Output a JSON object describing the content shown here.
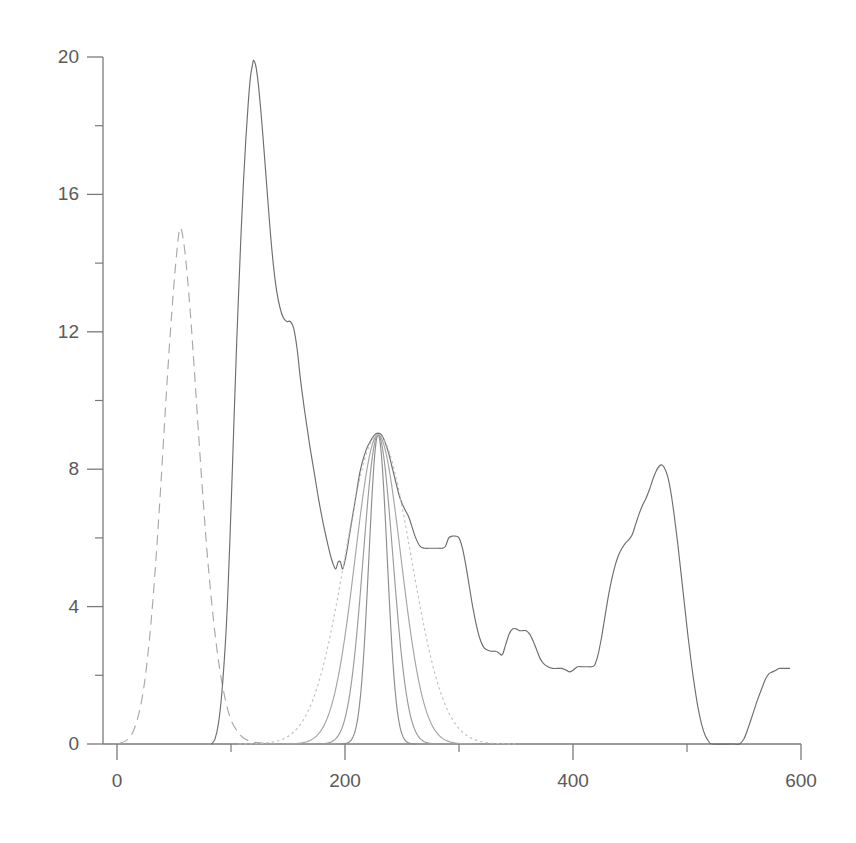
{
  "chart_data": {
    "type": "line",
    "title": "",
    "subtitle": "",
    "xlabel": "",
    "ylabel": "",
    "xlim": [
      0,
      600
    ],
    "ylim": [
      0,
      20.6
    ],
    "grid": false,
    "legend": "none",
    "background_color": "#ffffff",
    "axis_color": "#7a7a7a",
    "label_color": "#5a5a5a",
    "x_ticks_major": [
      0,
      200,
      400,
      600
    ],
    "x_ticks_major_labels": [
      "0",
      "200",
      "400",
      "600"
    ],
    "x_ticks_minor": [
      100,
      300,
      500
    ],
    "y_ticks_major": [
      0,
      4,
      8,
      12,
      16,
      20
    ],
    "y_ticks_major_labels": [
      "0",
      "4",
      "8",
      "12",
      "16",
      "20"
    ],
    "y_ticks_minor": [
      2,
      6,
      10,
      14,
      18
    ],
    "series": [
      {
        "name": "dashed-left-peak",
        "style": "dashed",
        "color": "#a8a8a8",
        "peak_x": 55,
        "peak_y": 15.0,
        "points": [
          [
            2,
            0.02
          ],
          [
            8,
            0.1
          ],
          [
            14,
            0.35
          ],
          [
            20,
            1.0
          ],
          [
            25,
            2.0
          ],
          [
            30,
            3.6
          ],
          [
            34,
            5.3
          ],
          [
            38,
            7.3
          ],
          [
            42,
            9.5
          ],
          [
            46,
            11.6
          ],
          [
            50,
            13.4
          ],
          [
            53,
            14.5
          ],
          [
            55,
            15.0
          ],
          [
            57,
            14.9
          ],
          [
            60,
            14.2
          ],
          [
            64,
            12.7
          ],
          [
            68,
            10.8
          ],
          [
            72,
            8.8
          ],
          [
            76,
            6.9
          ],
          [
            80,
            5.2
          ],
          [
            85,
            3.5
          ],
          [
            90,
            2.2
          ],
          [
            95,
            1.3
          ],
          [
            100,
            0.7
          ],
          [
            106,
            0.35
          ],
          [
            112,
            0.15
          ],
          [
            120,
            0.05
          ],
          [
            130,
            0.02
          ],
          [
            140,
            0.0
          ]
        ]
      },
      {
        "name": "main-spectrum",
        "style": "solid",
        "color": "#6e6e6e",
        "peak_x": 120,
        "peak_y": 19.9,
        "points": [
          [
            83,
            0.0
          ],
          [
            86,
            0.15
          ],
          [
            89,
            0.6
          ],
          [
            92,
            1.5
          ],
          [
            95,
            2.9
          ],
          [
            97,
            4.2
          ],
          [
            99,
            5.9
          ],
          [
            101,
            7.8
          ],
          [
            103,
            9.8
          ],
          [
            105,
            11.7
          ],
          [
            107,
            13.4
          ],
          [
            109,
            15.0
          ],
          [
            111,
            16.4
          ],
          [
            113,
            17.6
          ],
          [
            115,
            18.6
          ],
          [
            117,
            19.4
          ],
          [
            119,
            19.8
          ],
          [
            120,
            19.9
          ],
          [
            122,
            19.7
          ],
          [
            124,
            19.2
          ],
          [
            126,
            18.5
          ],
          [
            128,
            17.7
          ],
          [
            131,
            16.4
          ],
          [
            134,
            15.1
          ],
          [
            137,
            14.0
          ],
          [
            140,
            13.2
          ],
          [
            143,
            12.7
          ],
          [
            146,
            12.4
          ],
          [
            149,
            12.3
          ],
          [
            152,
            12.3
          ],
          [
            155,
            12.1
          ],
          [
            158,
            11.5
          ],
          [
            161,
            10.6
          ],
          [
            165,
            9.6
          ],
          [
            169,
            8.7
          ],
          [
            173,
            7.9
          ],
          [
            177,
            7.1
          ],
          [
            181,
            6.4
          ],
          [
            185,
            5.8
          ],
          [
            188,
            5.4
          ],
          [
            190,
            5.2
          ],
          [
            192,
            5.1
          ],
          [
            194,
            5.3
          ],
          [
            196,
            5.3
          ],
          [
            198,
            5.1
          ],
          [
            201,
            5.5
          ],
          [
            204,
            6.1
          ],
          [
            207,
            6.7
          ],
          [
            210,
            7.3
          ],
          [
            213,
            7.9
          ],
          [
            216,
            8.3
          ],
          [
            219,
            8.6
          ],
          [
            222,
            8.8
          ],
          [
            226,
            9.0
          ],
          [
            229,
            9.05
          ],
          [
            232,
            9.0
          ],
          [
            235,
            8.8
          ],
          [
            238,
            8.5
          ],
          [
            241,
            8.1
          ],
          [
            244,
            7.7
          ],
          [
            247,
            7.3
          ],
          [
            250,
            7.0
          ],
          [
            253,
            6.8
          ],
          [
            256,
            6.6
          ],
          [
            259,
            6.3
          ],
          [
            262,
            6.0
          ],
          [
            266,
            5.75
          ],
          [
            270,
            5.7
          ],
          [
            275,
            5.7
          ],
          [
            280,
            5.7
          ],
          [
            285,
            5.7
          ],
          [
            288,
            5.75
          ],
          [
            291,
            6.0
          ],
          [
            294,
            6.05
          ],
          [
            297,
            6.05
          ],
          [
            300,
            6.0
          ],
          [
            303,
            5.7
          ],
          [
            306,
            5.2
          ],
          [
            309,
            4.6
          ],
          [
            312,
            4.0
          ],
          [
            315,
            3.5
          ],
          [
            318,
            3.1
          ],
          [
            321,
            2.85
          ],
          [
            324,
            2.75
          ],
          [
            328,
            2.7
          ],
          [
            332,
            2.7
          ],
          [
            335,
            2.65
          ],
          [
            338,
            2.6
          ],
          [
            341,
            2.9
          ],
          [
            344,
            3.2
          ],
          [
            347,
            3.35
          ],
          [
            350,
            3.35
          ],
          [
            353,
            3.3
          ],
          [
            356,
            3.3
          ],
          [
            359,
            3.3
          ],
          [
            362,
            3.2
          ],
          [
            365,
            3.0
          ],
          [
            368,
            2.75
          ],
          [
            371,
            2.5
          ],
          [
            374,
            2.35
          ],
          [
            378,
            2.25
          ],
          [
            382,
            2.2
          ],
          [
            386,
            2.2
          ],
          [
            390,
            2.2
          ],
          [
            394,
            2.15
          ],
          [
            397,
            2.1
          ],
          [
            400,
            2.15
          ],
          [
            404,
            2.25
          ],
          [
            408,
            2.25
          ],
          [
            412,
            2.25
          ],
          [
            416,
            2.25
          ],
          [
            419,
            2.3
          ],
          [
            422,
            2.6
          ],
          [
            425,
            3.1
          ],
          [
            428,
            3.7
          ],
          [
            431,
            4.3
          ],
          [
            434,
            4.8
          ],
          [
            437,
            5.2
          ],
          [
            440,
            5.5
          ],
          [
            443,
            5.7
          ],
          [
            446,
            5.85
          ],
          [
            449,
            5.95
          ],
          [
            452,
            6.1
          ],
          [
            455,
            6.4
          ],
          [
            458,
            6.7
          ],
          [
            461,
            6.95
          ],
          [
            464,
            7.15
          ],
          [
            467,
            7.4
          ],
          [
            470,
            7.7
          ],
          [
            473,
            7.95
          ],
          [
            476,
            8.1
          ],
          [
            478,
            8.12
          ],
          [
            480,
            8.05
          ],
          [
            483,
            7.8
          ],
          [
            486,
            7.3
          ],
          [
            489,
            6.6
          ],
          [
            492,
            5.8
          ],
          [
            495,
            4.9
          ],
          [
            498,
            4.0
          ],
          [
            501,
            3.1
          ],
          [
            504,
            2.3
          ],
          [
            507,
            1.6
          ],
          [
            510,
            1.0
          ],
          [
            513,
            0.55
          ],
          [
            516,
            0.25
          ],
          [
            519,
            0.08
          ],
          [
            522,
            0.0
          ],
          [
            540,
            0.0
          ],
          [
            546,
            0.0
          ],
          [
            550,
            0.15
          ],
          [
            554,
            0.5
          ],
          [
            558,
            0.9
          ],
          [
            562,
            1.3
          ],
          [
            566,
            1.65
          ],
          [
            569,
            1.9
          ],
          [
            572,
            2.05
          ],
          [
            575,
            2.1
          ],
          [
            578,
            2.15
          ],
          [
            581,
            2.2
          ],
          [
            585,
            2.2
          ],
          [
            590,
            2.2
          ]
        ]
      },
      {
        "name": "gaussian-fit-narrow",
        "style": "solid",
        "color": "#8d8d8d",
        "peak_x": 229,
        "peak_y": 9.0,
        "sigma": 8.0
      },
      {
        "name": "gaussian-fit-medium",
        "style": "solid",
        "color": "#9a9a9a",
        "peak_x": 229,
        "peak_y": 9.0,
        "sigma": 13.0
      },
      {
        "name": "gaussian-fit-wide",
        "style": "solid",
        "color": "#a5a5a5",
        "peak_x": 229,
        "peak_y": 9.0,
        "sigma": 20.0
      },
      {
        "name": "gaussian-fit-widest",
        "style": "dashdot",
        "color": "#bdbdbd",
        "peak_x": 229,
        "peak_y": 9.0,
        "sigma": 29.0
      }
    ]
  }
}
